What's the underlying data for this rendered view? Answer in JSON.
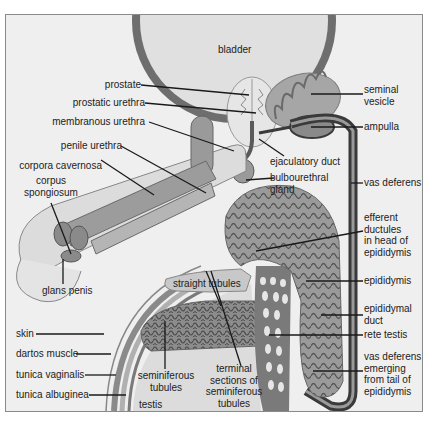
{
  "figure": {
    "colors": {
      "background": "#efefef",
      "frame": "#8a8a8a",
      "tissue_light": "#d9d9d9",
      "tissue_mid": "#a6a6a6",
      "tissue_dark": "#7d7d7d",
      "duct_dark": "#3a3a3a",
      "line": "#1a1a1a"
    }
  },
  "labels": {
    "bladder": "bladder",
    "prostate": "prostate",
    "prostatic_urethra": "prostatic urethra",
    "membranous_urethra": "membranous urethra",
    "penile_urethra": "penile urethra",
    "corpora_cavernosa": "corpora cavernosa",
    "corpus_spongiosum_1": "corpus",
    "corpus_spongiosum_2": "spongiosum",
    "glans_penis": "glans penis",
    "skin": "skin",
    "dartos_muscle": "dartos muscle",
    "tunica_vaginalis": "tunica vaginalis",
    "tunica_albuginea": "tunica albuginea",
    "testis": "testis",
    "seminiferous_tubules_1": "seminiferous",
    "seminiferous_tubules_2": "tubules",
    "straight_tubules": "straight tubules",
    "terminal_1": "terminal",
    "terminal_2": "sections of",
    "terminal_3": "seminiferous",
    "terminal_4": "tubules",
    "seminal_vesicle_1": "seminal",
    "seminal_vesicle_2": "vesicle",
    "ampulla": "ampulla",
    "ejaculatory_duct": "ejaculatory duct",
    "bulbourethral_1": "bulbourethral",
    "bulbourethral_2": "gland",
    "vas_deferens": "vas deferens",
    "efferent_1": "efferent",
    "efferent_2": "ductules",
    "efferent_3": "in head of",
    "efferent_4": "epididymis",
    "epididymis": "epididymis",
    "epididymal_duct_1": "epididymal",
    "epididymal_duct_2": "duct",
    "rete_testis": "rete testis",
    "vas_emerging_1": "vas deferens",
    "vas_emerging_2": "emerging",
    "vas_emerging_3": "from tail of",
    "vas_emerging_4": "epididymis"
  }
}
